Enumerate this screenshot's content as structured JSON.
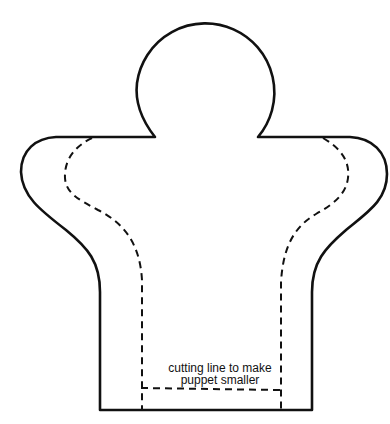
{
  "figure": {
    "annotation": {
      "line1": "cutting line to make",
      "line2": "puppet smaller"
    },
    "parts": {
      "outline": "puppet-body-outline",
      "head": "circular-head",
      "seam": "dashed-inner-line",
      "cut": "dashed-cutting-line"
    },
    "colors": {
      "stroke": "#111111",
      "background": "#ffffff"
    }
  }
}
